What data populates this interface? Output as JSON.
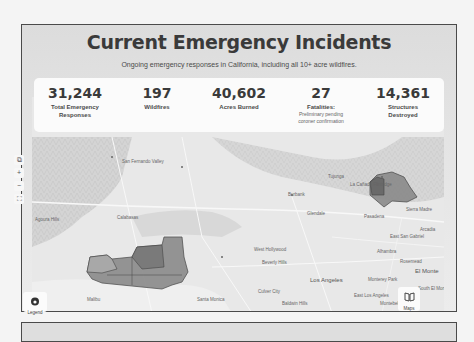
{
  "header": {
    "title": "Current Emergency Incidents",
    "subtitle": "Ongoing emergency responses in California, including all 10+ acre wildfires."
  },
  "stats": [
    {
      "value": "31,244",
      "label": "Total Emergency Responses",
      "note": ""
    },
    {
      "value": "197",
      "label": "Wildfires",
      "note": ""
    },
    {
      "value": "40,602",
      "label": "Acres Burned",
      "note": ""
    },
    {
      "value": "27",
      "label": "Fatalities:",
      "note": "Preliminary pending coroner confirmation"
    },
    {
      "value": "14,361",
      "label": "Structures Destroyed",
      "note": ""
    }
  ],
  "map": {
    "controls": {
      "layers": "⧉",
      "zoom_in": "+",
      "zoom_out": "−",
      "fullscreen": "⛶"
    },
    "legend_label": "Legend",
    "maps_label": "Maps",
    "places": {
      "simi_valley": "Simi Valley",
      "calabasas": "Calabasas",
      "agoura_hills": "Agoura Hills",
      "san_fernando_valley": "San Fernando Valley",
      "burbank": "Burbank",
      "tujunga": "Tujunga",
      "la_canada": "La Cañada Flintridge",
      "glendale": "Glendale",
      "pasadena": "Pasadena",
      "sierra_madre": "Sierra Madre",
      "arcadia": "Arcadia",
      "east_san_gabriel": "East San Gabriel",
      "alhambra": "Alhambra",
      "rosemead": "Rosemead",
      "el_monte": "El Monte",
      "monterey_park": "Monterey Park",
      "south_el_monte": "South El Monte",
      "avocado_heights": "Avocado Heights",
      "west_puente": "West Puente Valley",
      "east_los_angeles": "East Los Angeles",
      "montebello": "Montebello",
      "commerce": "Commerce",
      "los_angeles": "Los Angeles",
      "west_hollywood": "West Hollywood",
      "beverly_hills": "Beverly Hills",
      "culver_city": "Culver City",
      "santa_monica": "Santa Monica",
      "baldwin_hills": "Baldwin Hills",
      "duarte": "Duarte",
      "la_puente": "La Pu",
      "malibu": "Malibu"
    }
  },
  "colors": {
    "fire_area": "#7a7a7a",
    "frame_border": "#4a4a4a",
    "text_dark": "#3a3a3a"
  }
}
